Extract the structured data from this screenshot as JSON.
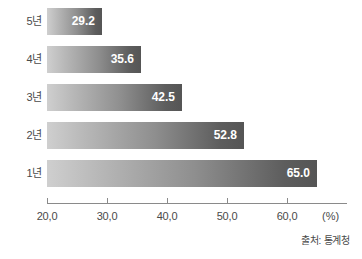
{
  "chart_data": {
    "type": "bar",
    "orientation": "horizontal",
    "title": "",
    "xlabel": "(%)",
    "ylabel": "",
    "categories": [
      "5년",
      "4년",
      "3년",
      "2년",
      "1년"
    ],
    "values": [
      29.2,
      35.6,
      42.5,
      52.8,
      65.0
    ],
    "value_labels": [
      "29.2",
      "35.6",
      "42.5",
      "52.8",
      "65.0"
    ],
    "xlim": [
      20.0,
      70.0
    ],
    "xticks": [
      20.0,
      30.0,
      40.0,
      50.0,
      60.0
    ],
    "xtick_labels": [
      "20,0",
      "30,0",
      "40,0",
      "50,0",
      "60,0"
    ],
    "grid": false,
    "legend": null,
    "unit": "(%)",
    "source": "출처: 통계청",
    "bar_gradient_from": "#cfcfcf",
    "bar_gradient_to": "#555555",
    "axis_color": "#8a8a8a",
    "text_color": "#4a4a4a",
    "value_label_color": "#ffffff",
    "background": "#ffffff"
  },
  "bars": [
    {
      "category": "5년",
      "value": 29.2,
      "label": "29.2"
    },
    {
      "category": "4년",
      "value": 35.6,
      "label": "35.6"
    },
    {
      "category": "3년",
      "value": 42.5,
      "label": "42.5"
    },
    {
      "category": "2년",
      "value": 52.8,
      "label": "52.8"
    },
    {
      "category": "1년",
      "value": 65.0,
      "label": "65.0"
    }
  ],
  "axis": {
    "ticks": [
      {
        "value": 20.0,
        "label": "20,0"
      },
      {
        "value": 30.0,
        "label": "30,0"
      },
      {
        "value": 40.0,
        "label": "40,0"
      },
      {
        "value": 50.0,
        "label": "50,0"
      },
      {
        "value": 60.0,
        "label": "60,0"
      }
    ],
    "unit": "(%)"
  },
  "footer": {
    "source": "출처: 통계청"
  }
}
